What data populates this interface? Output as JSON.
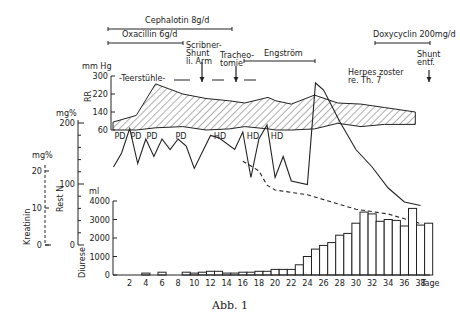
{
  "caption": "Abb. 1",
  "therapies": [
    {
      "label": "Cephalotin 8g/d",
      "x1": 108,
      "x2": 232,
      "y": 29,
      "lx": 145,
      "ly": 23
    },
    {
      "label": "Oxacillin 6g/d",
      "x1": 108,
      "x2": 183,
      "y": 43,
      "lx": 122,
      "ly": 37
    },
    {
      "label": "Engström",
      "x1": 244,
      "x2": 315,
      "y": 61,
      "lx": 264,
      "ly": 56
    },
    {
      "label": "Doxycyclin 200mg/d",
      "x1": 375,
      "x2": 430,
      "y": 43,
      "lx": 373,
      "ly": 37
    }
  ],
  "events": [
    {
      "label_lines": [
        "Scribner-",
        "Shunt",
        "li. Arm"
      ],
      "x": 202,
      "arrow_top": 62,
      "arrow_bottom": 82
    },
    {
      "label_lines": [
        "Tracheo-",
        "tomie"
      ],
      "x": 236,
      "arrow_top": 66,
      "arrow_bottom": 82
    },
    {
      "label_lines": [
        "Shunt",
        "entf."
      ],
      "x": 429,
      "arrow_top": 70,
      "arrow_bottom": 82
    },
    {
      "label_lines": [
        "Herpes zoster",
        "re. Th. 7"
      ],
      "x": 380,
      "arrow_top": null,
      "arrow_bottom": null
    }
  ],
  "teerstuehle_label": "-Teerstühle-",
  "dialysis_labels": [
    {
      "label": "PD",
      "x": 120
    },
    {
      "label": "PD",
      "x": 136
    },
    {
      "label": "PD",
      "x": 152
    },
    {
      "label": "PD",
      "x": 181
    },
    {
      "label": "HD",
      "x": 220
    },
    {
      "label": "HD",
      "x": 253
    },
    {
      "label": "HD",
      "x": 277
    }
  ],
  "axes": {
    "rr": {
      "unit": "mm Hg",
      "label": "RR",
      "ticks": [
        "300",
        "220",
        "140",
        "60"
      ]
    },
    "rest_n": {
      "unit": "mg%",
      "label": "Rest N",
      "ticks": [
        "200",
        "100",
        "0"
      ]
    },
    "kreatinin": {
      "unit": "mg%",
      "label": "Kreatinin",
      "ticks": [
        "20",
        "10",
        "0"
      ]
    },
    "diurese": {
      "unit": "ml",
      "label": "Diurese",
      "ticks": [
        "4000",
        "3000",
        "2000",
        "1000",
        "0"
      ]
    },
    "x": {
      "unit": "Tage",
      "ticks": [
        "2",
        "4",
        "6",
        "8",
        "10",
        "12",
        "14",
        "16",
        "18",
        "20",
        "22",
        "24",
        "26",
        "28",
        "30",
        "32",
        "34",
        "36",
        "38"
      ]
    }
  },
  "chart_data": [
    {
      "type": "area",
      "title": "RR (Blutdruck) systolisch/diastolisch",
      "ylabel": "RR mm Hg",
      "ylim": [
        60,
        300
      ],
      "x": [
        0,
        3,
        5.5,
        9,
        12,
        15,
        17,
        20,
        21,
        23,
        26,
        29,
        32,
        35,
        39
      ],
      "series": [
        {
          "name": "systolisch",
          "values": [
            95,
            125,
            265,
            220,
            200,
            190,
            180,
            205,
            190,
            175,
            215,
            180,
            175,
            160,
            140
          ]
        },
        {
          "name": "diastolisch",
          "values": [
            60,
            60,
            70,
            75,
            60,
            65,
            75,
            65,
            60,
            60,
            65,
            90,
            75,
            85,
            85
          ]
        }
      ]
    },
    {
      "type": "line",
      "title": "Rest N",
      "ylabel": "Rest N mg%",
      "ylim": [
        0,
        200
      ],
      "x": [
        0,
        1,
        2,
        3,
        4,
        5,
        6,
        7,
        8,
        9,
        10,
        12,
        13,
        15,
        16,
        17,
        18,
        19,
        20,
        21,
        22,
        24,
        25,
        26,
        28,
        30,
        32,
        34,
        36,
        38
      ],
      "values": [
        90,
        110,
        145,
        95,
        130,
        105,
        130,
        115,
        130,
        120,
        88,
        135,
        132,
        115,
        140,
        75,
        130,
        150,
        75,
        105,
        70,
        65,
        210,
        200,
        155,
        115,
        90,
        60,
        40,
        35
      ]
    },
    {
      "type": "line",
      "title": "Kreatinin",
      "ylabel": "Kreatinin mg%",
      "ylim": [
        0,
        20
      ],
      "x": [
        16,
        18,
        19,
        20,
        24,
        26,
        30,
        34,
        36,
        38
      ],
      "values": [
        10.5,
        9.5,
        8,
        7.5,
        7,
        6.5,
        5.5,
        5,
        4.5,
        4
      ],
      "style": "dashed"
    },
    {
      "type": "bar",
      "title": "Diurese",
      "xlabel": "Tage",
      "ylabel": "Diurese ml",
      "ylim": [
        0,
        4000
      ],
      "categories": [
        1,
        2,
        3,
        4,
        5,
        6,
        7,
        8,
        9,
        10,
        11,
        12,
        13,
        14,
        15,
        16,
        17,
        18,
        19,
        20,
        21,
        22,
        23,
        24,
        25,
        26,
        27,
        28,
        29,
        30,
        31,
        32,
        33,
        34,
        35,
        36,
        37,
        38,
        39
      ],
      "values": [
        0,
        0,
        0,
        100,
        0,
        150,
        0,
        0,
        150,
        100,
        150,
        200,
        200,
        100,
        100,
        150,
        150,
        200,
        200,
        300,
        300,
        300,
        550,
        1000,
        1400,
        1600,
        1750,
        2150,
        2250,
        2800,
        3400,
        3300,
        2900,
        3000,
        2950,
        2650,
        3600,
        2700,
        2800
      ]
    }
  ]
}
